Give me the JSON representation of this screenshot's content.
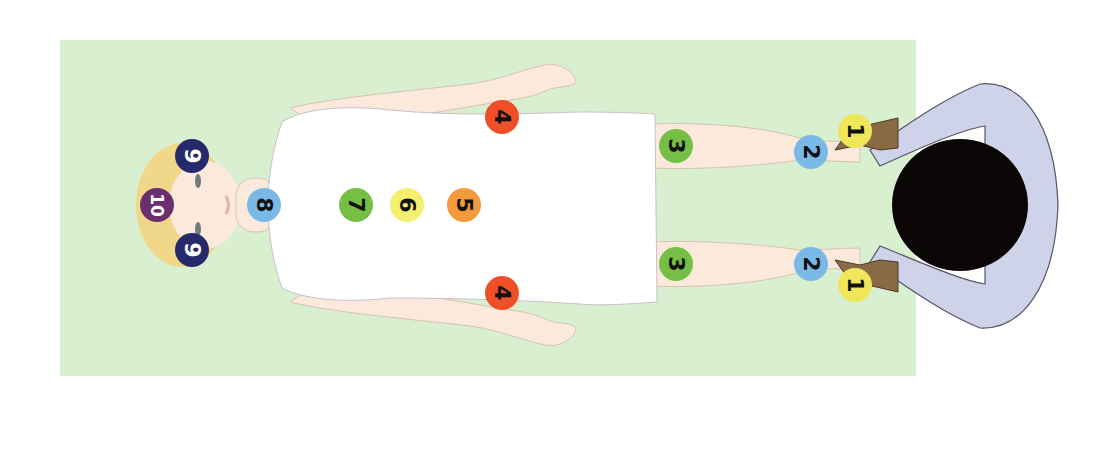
{
  "diagram": {
    "colors": {
      "mat": "#d8f0cf",
      "skin": "#fbeadc",
      "skin_outline": "#d9c2ae",
      "sheet": "#ffffff",
      "sheet_outline": "#c9c0c8",
      "hair_client": "#f0d78a",
      "practitioner_shirt": "#cfd3ea",
      "practitioner_skin": "#8a6a45",
      "practitioner_hair": "#0a0606"
    },
    "markers": [
      {
        "id": "m1a",
        "label": "1",
        "x": 855,
        "y": 131,
        "color": "#efe65a",
        "text_color": "#111111",
        "name": "position-1-left-foot"
      },
      {
        "id": "m1b",
        "label": "1",
        "x": 855,
        "y": 285,
        "color": "#efe65a",
        "text_color": "#111111",
        "name": "position-1-right-foot"
      },
      {
        "id": "m2a",
        "label": "2",
        "x": 811,
        "y": 152,
        "color": "#7ab8e6",
        "text_color": "#111111",
        "name": "position-2-left-ankle"
      },
      {
        "id": "m2b",
        "label": "2",
        "x": 811,
        "y": 264,
        "color": "#7ab8e6",
        "text_color": "#111111",
        "name": "position-2-right-ankle"
      },
      {
        "id": "m3a",
        "label": "3",
        "x": 676,
        "y": 146,
        "color": "#76bf45",
        "text_color": "#111111",
        "name": "position-3-left-knee"
      },
      {
        "id": "m3b",
        "label": "3",
        "x": 676,
        "y": 264,
        "color": "#76bf45",
        "text_color": "#111111",
        "name": "position-3-right-knee"
      },
      {
        "id": "m4a",
        "label": "4",
        "x": 502,
        "y": 117,
        "color": "#ee4f26",
        "text_color": "#111111",
        "name": "position-4-left-hand"
      },
      {
        "id": "m4b",
        "label": "4",
        "x": 502,
        "y": 293,
        "color": "#ee4f26",
        "text_color": "#111111",
        "name": "position-4-right-hand"
      },
      {
        "id": "m5",
        "label": "5",
        "x": 464,
        "y": 205,
        "color": "#f59a3c",
        "text_color": "#111111",
        "name": "position-5-abdomen"
      },
      {
        "id": "m6",
        "label": "6",
        "x": 407,
        "y": 205,
        "color": "#f4ef6e",
        "text_color": "#111111",
        "name": "position-6-solar-plexus"
      },
      {
        "id": "m7",
        "label": "7",
        "x": 356,
        "y": 205,
        "color": "#76bf45",
        "text_color": "#111111",
        "name": "position-7-heart"
      },
      {
        "id": "m8",
        "label": "8",
        "x": 264,
        "y": 205,
        "color": "#7ab8e6",
        "text_color": "#111111",
        "name": "position-8-throat"
      },
      {
        "id": "m9a",
        "label": "9",
        "x": 192,
        "y": 156,
        "color": "#262a6b",
        "text_color": "#ffffff",
        "name": "position-9-left-temple"
      },
      {
        "id": "m9b",
        "label": "9",
        "x": 192,
        "y": 250,
        "color": "#262a6b",
        "text_color": "#ffffff",
        "name": "position-9-right-temple"
      },
      {
        "id": "m10",
        "label": "10",
        "x": 157,
        "y": 205,
        "color": "#6b2f6e",
        "text_color": "#ffffff",
        "name": "position-10-crown"
      }
    ]
  }
}
